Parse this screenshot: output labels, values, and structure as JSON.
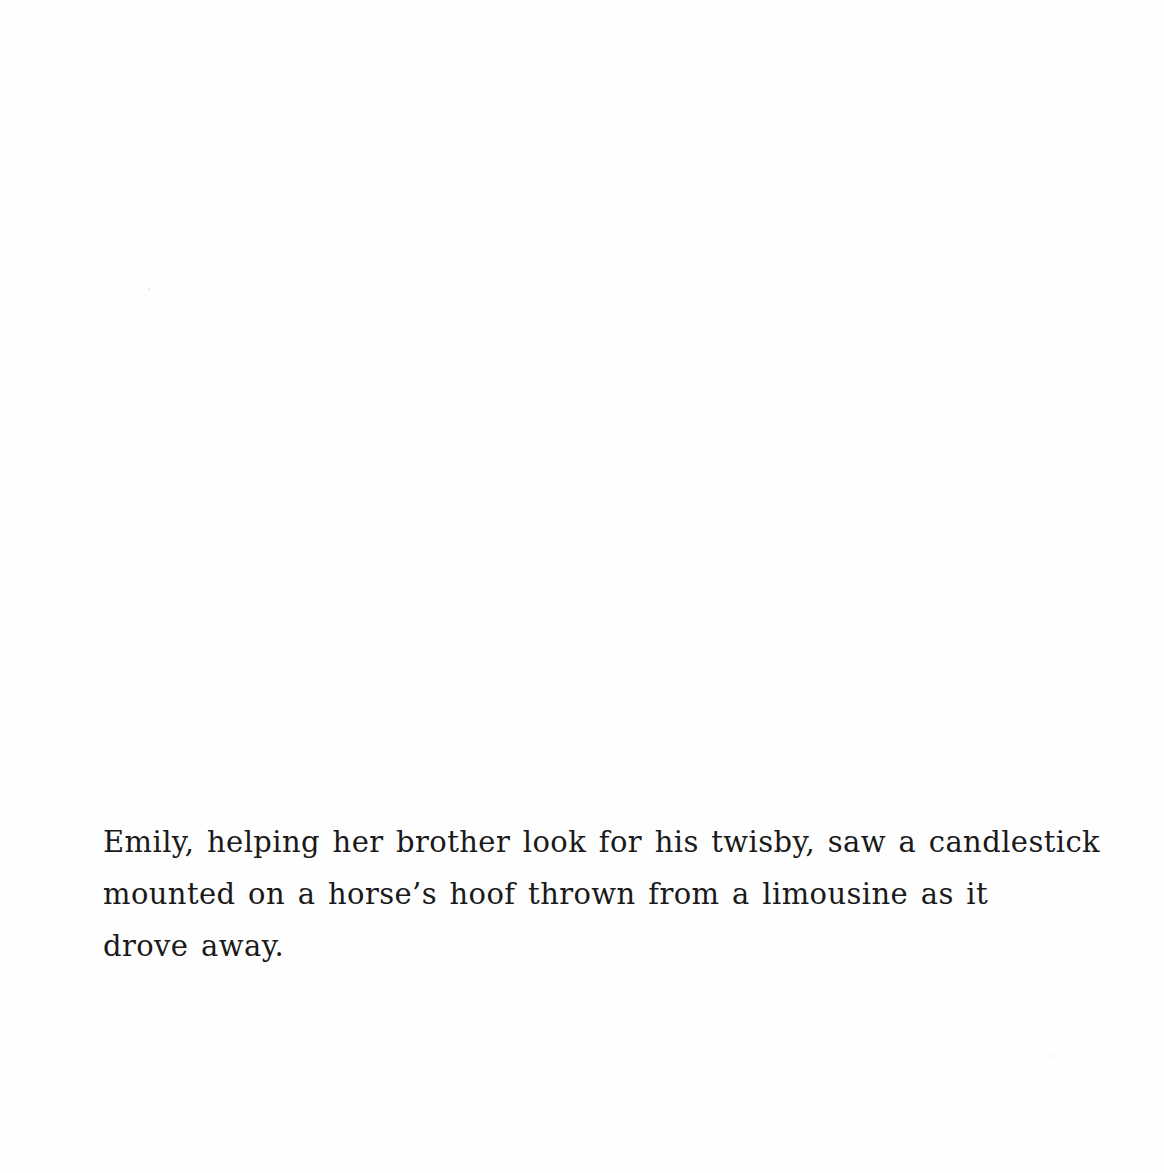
{
  "caption": {
    "lines": [
      "Emily, helping her brother look for his twisby, saw a candlestick",
      "mounted on a horse’s hoof thrown from a limousine as it",
      "drove away."
    ],
    "full_text": "Emily, helping her brother look for his twisby, saw a candlestick mounted on a horse’s hoof thrown from a limousine as it drove away."
  },
  "colors": {
    "background": "#fefefe",
    "text": "#1a1a1a"
  }
}
